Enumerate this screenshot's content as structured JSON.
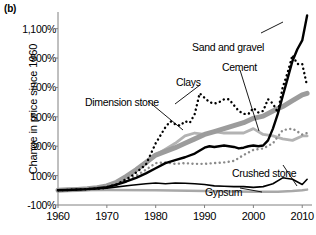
{
  "figure": {
    "panel_label": "(b)",
    "ylabel": "Change in price since 1960",
    "xlabel": ""
  },
  "chart_data": {
    "type": "line",
    "title": "",
    "xlabel": "",
    "ylabel": "Change in price since 1960",
    "xlim": [
      1960,
      2012
    ],
    "ylim": [
      -100,
      1200
    ],
    "grid": false,
    "legend": "annotations-inline",
    "xticks": [
      1960,
      1970,
      1980,
      1990,
      2000,
      2010
    ],
    "xtick_labels": [
      "1960",
      "1970",
      "1980",
      "1990",
      "2000",
      "2010"
    ],
    "yticks": [
      -100,
      100,
      300,
      500,
      700,
      900,
      1100
    ],
    "ytick_labels": [
      "-100%",
      "100%",
      "300%",
      "500%",
      "700%",
      "900%",
      "1,100%"
    ],
    "series": [
      {
        "name": "Sand and gravel",
        "style": "solid",
        "color": "#000000",
        "width": 2.4,
        "x": [
          1960,
          1962,
          1964,
          1966,
          1968,
          1970,
          1972,
          1974,
          1976,
          1978,
          1980,
          1982,
          1984,
          1986,
          1988,
          1990,
          1991,
          1992,
          1993,
          1994,
          1995,
          1996,
          1997,
          1998,
          1999,
          2000,
          2001,
          2002,
          2003,
          2004,
          2005,
          2006,
          2007,
          2008,
          2009,
          2010,
          2011
        ],
        "values": [
          0,
          2,
          5,
          8,
          14,
          22,
          38,
          60,
          85,
          115,
          150,
          185,
          205,
          225,
          250,
          290,
          300,
          295,
          300,
          305,
          300,
          295,
          285,
          290,
          300,
          305,
          300,
          305,
          340,
          420,
          520,
          640,
          760,
          880,
          960,
          1020,
          1190
        ]
      },
      {
        "name": "Cement",
        "style": "solid",
        "color": "#9c9c9c",
        "width": 5.0,
        "x": [
          1960,
          1962,
          1964,
          1966,
          1968,
          1970,
          1972,
          1974,
          1976,
          1978,
          1980,
          1982,
          1984,
          1986,
          1988,
          1990,
          1992,
          1994,
          1996,
          1998,
          2000,
          2002,
          2004,
          2006,
          2008,
          2010,
          2011
        ],
        "values": [
          0,
          3,
          6,
          10,
          18,
          30,
          55,
          95,
          140,
          190,
          240,
          265,
          290,
          320,
          350,
          380,
          400,
          420,
          440,
          460,
          490,
          505,
          540,
          570,
          610,
          650,
          660
        ]
      },
      {
        "name": "Clays",
        "style": "dotted",
        "color": "#000000",
        "width": 2.4,
        "x": [
          1960,
          1963,
          1966,
          1969,
          1972,
          1975,
          1978,
          1980,
          1982,
          1983,
          1984,
          1985,
          1986,
          1987,
          1988,
          1989,
          1990,
          1991,
          1992,
          1993,
          1994,
          1995,
          1996,
          1997,
          1998,
          1999,
          2000,
          2001,
          2002,
          2003,
          2004,
          2005,
          2006,
          2007,
          2008,
          2009,
          2010,
          2011
        ],
        "values": [
          0,
          4,
          8,
          12,
          40,
          95,
          175,
          320,
          430,
          470,
          450,
          440,
          470,
          460,
          520,
          660,
          630,
          600,
          590,
          600,
          620,
          620,
          580,
          540,
          520,
          520,
          560,
          530,
          540,
          620,
          590,
          530,
          700,
          800,
          920,
          860,
          860,
          710
        ]
      },
      {
        "name": "Dimension stone",
        "style": "solid",
        "color": "#b3b3b3",
        "width": 2.8,
        "x": [
          1960,
          1963,
          1966,
          1969,
          1972,
          1975,
          1978,
          1980,
          1982,
          1984,
          1986,
          1988,
          1990,
          1992,
          1994,
          1996,
          1998,
          2000,
          2002,
          2004,
          2006,
          2008,
          2010,
          2011
        ],
        "values": [
          0,
          5,
          10,
          20,
          55,
          110,
          180,
          240,
          280,
          320,
          370,
          390,
          380,
          400,
          390,
          390,
          390,
          420,
          380,
          370,
          350,
          340,
          370,
          370
        ]
      },
      {
        "name": "Crushed stone",
        "style": "dotted",
        "color": "#8a8a8a",
        "width": 2.4,
        "x": [
          1960,
          1965,
          1970,
          1975,
          1978,
          1980,
          1982,
          1984,
          1986,
          1988,
          1990,
          1992,
          1994,
          1996,
          1998,
          2000,
          2002,
          2004,
          2006,
          2008,
          2010,
          2011
        ],
        "values": [
          0,
          6,
          20,
          80,
          140,
          185,
          190,
          180,
          185,
          180,
          180,
          185,
          190,
          200,
          240,
          275,
          285,
          320,
          410,
          420,
          380,
          390
        ]
      },
      {
        "name": "Gypsum",
        "style": "solid",
        "color": "#000000",
        "width": 1.6,
        "x": [
          1960,
          1965,
          1970,
          1975,
          1978,
          1980,
          1982,
          1984,
          1986,
          1988,
          1990,
          1992,
          1994,
          1996,
          1998,
          2000,
          2002,
          2004,
          2006,
          2008,
          2010,
          2011
        ],
        "values": [
          0,
          5,
          15,
          35,
          45,
          50,
          45,
          50,
          48,
          45,
          40,
          30,
          28,
          25,
          25,
          20,
          25,
          45,
          85,
          75,
          40,
          75
        ]
      },
      {
        "name": "Baseline-gray",
        "style": "solid",
        "color": "#a8a8a8",
        "width": 2.4,
        "x": [
          1960,
          1970,
          1980,
          1990,
          2000,
          2005,
          2008,
          2010,
          2011
        ],
        "values": [
          0,
          2,
          0,
          -5,
          -10,
          -10,
          -5,
          0,
          5
        ]
      }
    ],
    "annotations": [
      {
        "text": "Sand and gravel",
        "x_px": 192,
        "y_px": 42
      },
      {
        "text": "Cement",
        "x_px": 222,
        "y_px": 62
      },
      {
        "text": "Clays",
        "x_px": 176,
        "y_px": 77
      },
      {
        "text": "Dimension stone",
        "x_px": 85,
        "y_px": 97
      },
      {
        "text": "Crushed stone",
        "x_px": 232,
        "y_px": 168
      },
      {
        "text": "Gypsum",
        "x_px": 205,
        "y_px": 187
      }
    ]
  }
}
